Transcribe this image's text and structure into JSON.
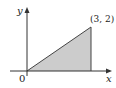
{
  "diagram": {
    "axes": {
      "x_label": "x",
      "y_label": "y",
      "origin_label": "0"
    },
    "region": {
      "shape": "triangle",
      "vertices": [
        [
          0,
          0
        ],
        [
          3,
          0
        ],
        [
          3,
          2
        ]
      ],
      "fill": "#cccccc",
      "stroke": "#444444"
    },
    "point_label": "(3, 2)",
    "colors": {
      "axis": "#333333",
      "fill": "#cccccc",
      "edge": "#444444"
    }
  }
}
